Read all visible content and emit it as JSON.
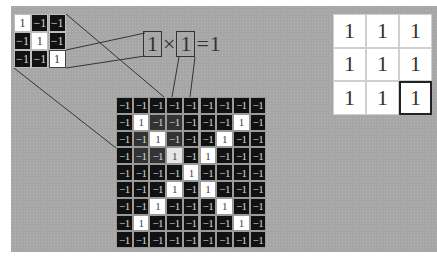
{
  "kernel": {
    "rows": [
      [
        "1",
        "−1",
        "−1"
      ],
      [
        "−1",
        "1",
        "−1"
      ],
      [
        "−1",
        "−1",
        "1"
      ]
    ],
    "highlighted_cell": [
      2,
      2
    ]
  },
  "equation": {
    "left_operand": "1",
    "operator": "×",
    "right_operand": "1",
    "equals": "=",
    "result": "1"
  },
  "image_grid": {
    "rows": [
      [
        "−1",
        "−1",
        "−1",
        "−1",
        "−1",
        "−1",
        "−1",
        "−1",
        "−1"
      ],
      [
        "−1",
        "1",
        "−1",
        "−1",
        "−1",
        "−1",
        "−1",
        "1",
        "−1"
      ],
      [
        "−1",
        "−1",
        "1",
        "−1",
        "−1",
        "−1",
        "1",
        "−1",
        "−1"
      ],
      [
        "−1",
        "−1",
        "−1",
        "1",
        "−1",
        "1",
        "−1",
        "−1",
        "−1"
      ],
      [
        "−1",
        "−1",
        "−1",
        "−1",
        "1",
        "−1",
        "−1",
        "−1",
        "−1"
      ],
      [
        "−1",
        "−1",
        "−1",
        "1",
        "−1",
        "1",
        "−1",
        "−1",
        "−1"
      ],
      [
        "−1",
        "−1",
        "1",
        "−1",
        "−1",
        "−1",
        "1",
        "−1",
        "−1"
      ],
      [
        "−1",
        "1",
        "−1",
        "−1",
        "−1",
        "−1",
        "−1",
        "1",
        "−1"
      ],
      [
        "−1",
        "−1",
        "−1",
        "−1",
        "−1",
        "−1",
        "−1",
        "−1",
        "−1"
      ]
    ],
    "highlighted_window": {
      "row_start": 1,
      "col_start": 1,
      "size": 3
    },
    "highlighted_cell": [
      3,
      3
    ]
  },
  "result_grid": {
    "rows": [
      [
        "1",
        "1",
        "1"
      ],
      [
        "1",
        "1",
        "1"
      ],
      [
        "1",
        "1",
        "1"
      ]
    ],
    "highlighted_cell": [
      2,
      2
    ]
  }
}
